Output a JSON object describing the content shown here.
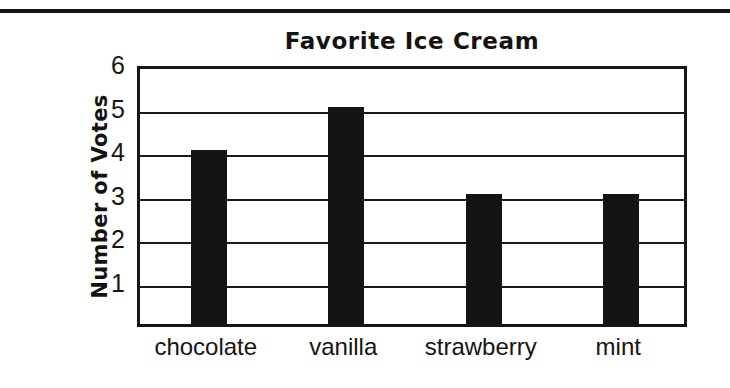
{
  "page": {
    "background_color": "#ffffff",
    "ink_color": "#141414",
    "top_rule": true
  },
  "chart_data": {
    "type": "bar",
    "title": "Favorite Ice Cream",
    "xlabel": "",
    "ylabel": "Number of Votes",
    "categories": [
      "chocolate",
      "vanilla",
      "strawberry",
      "mint"
    ],
    "values": [
      4,
      5,
      3,
      3
    ],
    "ylim": [
      0,
      6
    ],
    "yticks": [
      "1",
      "2",
      "3",
      "4",
      "5",
      "6"
    ],
    "ytick_values": [
      1,
      2,
      3,
      4,
      5,
      6
    ],
    "grid": "horizontal",
    "legend": "none",
    "bar_color": "#141414",
    "axis_color": "#161616"
  }
}
